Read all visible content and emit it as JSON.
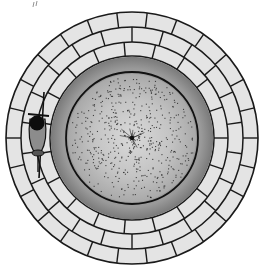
{
  "illustration": {
    "title": "Top-down view of a circular brick well with a figure at its rim",
    "colors": {
      "background": "#ffffff",
      "brick_fill": "#e4e4e4",
      "mortar_line": "#1a1a1a",
      "inner_band": "#8a8a8a",
      "water_surface": "#bdbdbd",
      "water_center": "#d8d8d8",
      "speckle": "#2a2a2a",
      "figure_body": "#8c8c8c",
      "figure_head": "#0d0d0d"
    },
    "geometry": {
      "center_x": 132,
      "center_y": 138,
      "outer_radius": 126,
      "brick_ring_radii": [
        126,
        111,
        96,
        82
      ],
      "dark_band_inner_radius": 66,
      "water_radius": 64
    },
    "brick_rings": [
      {
        "name": "outer-ring",
        "count": 26
      },
      {
        "name": "middle-ring",
        "count": 22
      },
      {
        "name": "inner-ring",
        "count": 19
      }
    ],
    "figure": {
      "label": "person-with-staff",
      "position": "left rim",
      "x": 37,
      "y": 122
    },
    "corner_mark": "top-left sketch mark"
  }
}
